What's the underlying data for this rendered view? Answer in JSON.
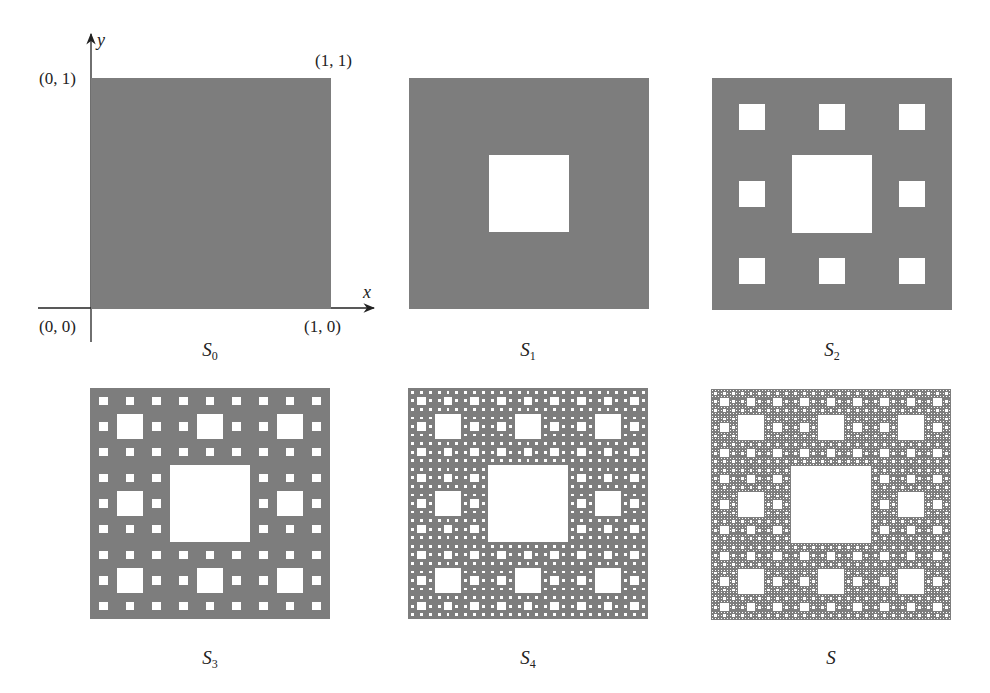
{
  "figure": {
    "fill_color": "#7d7d7d",
    "hole_color": "#ffffff",
    "axis_color": "#222222",
    "panels": [
      {
        "id": "s0",
        "caption": "S",
        "subscript": "0",
        "level": 0,
        "x": 91,
        "y": 78,
        "w": 240,
        "h": 231,
        "caption_x": 210,
        "caption_y": 340
      },
      {
        "id": "s1",
        "caption": "S",
        "subscript": "1",
        "level": 1,
        "x": 409,
        "y": 78,
        "w": 240,
        "h": 231,
        "caption_x": 528,
        "caption_y": 340
      },
      {
        "id": "s2",
        "caption": "S",
        "subscript": "2",
        "level": 2,
        "x": 712,
        "y": 78,
        "w": 240,
        "h": 232,
        "caption_x": 832,
        "caption_y": 340
      },
      {
        "id": "s3",
        "caption": "S",
        "subscript": "3",
        "level": 3,
        "x": 90,
        "y": 388,
        "w": 240,
        "h": 231,
        "caption_x": 210,
        "caption_y": 648
      },
      {
        "id": "s4",
        "caption": "S",
        "subscript": "4",
        "level": 4,
        "x": 408,
        "y": 388,
        "w": 240,
        "h": 231,
        "caption_x": 528,
        "caption_y": 648
      },
      {
        "id": "s",
        "caption": "S",
        "subscript": "",
        "level": 5,
        "x": 711,
        "y": 389,
        "w": 240,
        "h": 231,
        "caption_x": 831,
        "caption_y": 648
      }
    ],
    "axes": {
      "x_label": "x",
      "y_label": "y",
      "point_labels": {
        "origin": "(0, 0)",
        "x_unit": "(1, 0)",
        "y_unit": "(0, 1)",
        "corner": "(1, 1)"
      }
    }
  }
}
